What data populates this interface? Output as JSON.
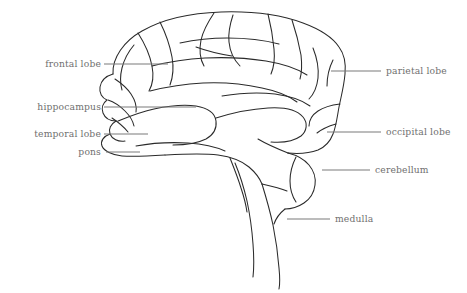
{
  "figure": {
    "background_color": "#ffffff",
    "outline_color": "#2a2a2a",
    "label_color": "#6f6f6f",
    "leader_color": "#7b7b7b"
  },
  "labels": {
    "frontal_lobe": "frontal lobe",
    "hippocampus": "hippocampus",
    "temporal_lobe": "temporal lobe",
    "pons": "pons",
    "parietal_lobe": "parietal lobe",
    "occipital_lobe": "occipital lobe",
    "cerebellum": "cerebellum",
    "medulla": "medulla"
  },
  "label_list": [
    {
      "id": "frontal-lobe",
      "text": "frontal lobe",
      "side": "left",
      "text_x": 101,
      "text_y": 67,
      "line_x1": 104,
      "line_x2": 168,
      "line_y": 64
    },
    {
      "id": "hippocampus",
      "text": "hippocampus",
      "side": "left",
      "text_x": 101,
      "text_y": 110,
      "line_x1": 104,
      "line_x2": 196,
      "line_y": 107
    },
    {
      "id": "temporal-lobe",
      "text": "temporal lobe",
      "side": "left",
      "text_x": 101,
      "text_y": 137,
      "line_x1": 104,
      "line_x2": 148,
      "line_y": 134
    },
    {
      "id": "pons",
      "text": "pons",
      "side": "left",
      "text_x": 101,
      "text_y": 155,
      "line_x1": 106,
      "line_x2": 140,
      "line_y": 152
    },
    {
      "id": "parietal-lobe",
      "text": "parietal lobe",
      "side": "right",
      "text_x": 386,
      "text_y": 74,
      "line_x1": 331,
      "line_x2": 381,
      "line_y": 71
    },
    {
      "id": "occipital-lobe",
      "text": "occipital lobe",
      "side": "right",
      "text_x": 386,
      "text_y": 135,
      "line_x1": 327,
      "line_x2": 381,
      "line_y": 132
    },
    {
      "id": "cerebellum",
      "text": "cerebellum",
      "side": "right",
      "text_x": 375,
      "text_y": 173,
      "line_x1": 322,
      "line_x2": 370,
      "line_y": 170
    },
    {
      "id": "medulla",
      "text": "medulla",
      "side": "right",
      "text_x": 335,
      "text_y": 222,
      "line_x1": 287,
      "line_x2": 330,
      "line_y": 219
    }
  ]
}
